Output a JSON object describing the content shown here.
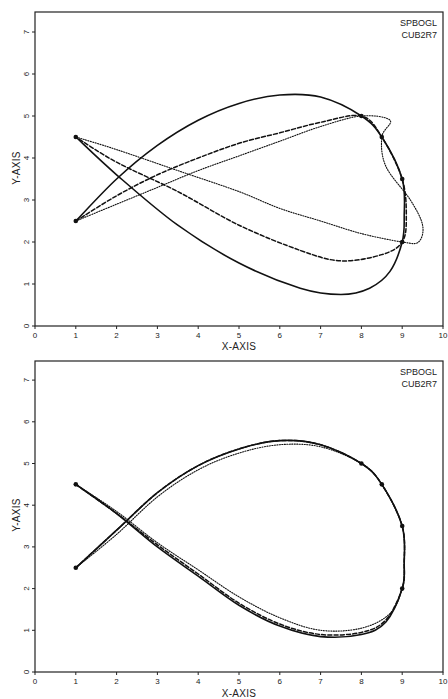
{
  "chart_data": [
    {
      "type": "line",
      "title": "",
      "xlabel": "X-AXIS",
      "ylabel": "Y-AXIS",
      "xlim": [
        0,
        10
      ],
      "ylim": [
        0,
        7.5
      ],
      "xticks": [
        "0",
        "1",
        "2",
        "3",
        "4",
        "5",
        "6",
        "7",
        "8",
        "9",
        "10"
      ],
      "yticks": [
        "0",
        "1",
        "2",
        "3",
        "4",
        "5",
        "6",
        "7"
      ],
      "grid": false,
      "legend": [
        "SPBOGL",
        "CUB2R7"
      ],
      "legend_position": "top-right",
      "nodes": [
        [
          1,
          2.5
        ],
        [
          1,
          4.5
        ],
        [
          8,
          5
        ],
        [
          8.5,
          4.5
        ],
        [
          9,
          3.5
        ],
        [
          9,
          2
        ]
      ],
      "series": [
        {
          "name": "solid",
          "style": "solid",
          "points": [
            [
              1,
              2.5
            ],
            [
              2,
              3.5
            ],
            [
              3,
              4.3
            ],
            [
              4,
              4.9
            ],
            [
              5,
              5.3
            ],
            [
              6,
              5.5
            ],
            [
              7,
              5.45
            ],
            [
              8,
              5.0
            ],
            [
              8.5,
              4.5
            ],
            [
              9,
              3.5
            ],
            [
              9.05,
              2.6
            ],
            [
              9,
              2.0
            ],
            [
              8.7,
              1.3
            ],
            [
              8.2,
              0.9
            ],
            [
              7.5,
              0.75
            ],
            [
              6.5,
              0.9
            ],
            [
              5,
              1.5
            ],
            [
              3.5,
              2.4
            ],
            [
              2,
              3.6
            ],
            [
              1,
              4.5
            ]
          ]
        },
        {
          "name": "dashed",
          "style": "dashed",
          "points": [
            [
              1,
              2.5
            ],
            [
              2,
              3.1
            ],
            [
              3,
              3.6
            ],
            [
              4,
              4.0
            ],
            [
              5,
              4.35
            ],
            [
              6,
              4.6
            ],
            [
              7,
              4.85
            ],
            [
              8,
              5.0
            ],
            [
              8.5,
              4.5
            ],
            [
              9,
              3.5
            ],
            [
              9.1,
              2.6
            ],
            [
              9,
              2.0
            ],
            [
              8.5,
              1.7
            ],
            [
              7.5,
              1.55
            ],
            [
              6.5,
              1.8
            ],
            [
              5,
              2.4
            ],
            [
              3.5,
              3.2
            ],
            [
              2,
              3.9
            ],
            [
              1,
              4.5
            ]
          ]
        },
        {
          "name": "dotted",
          "style": "dotted",
          "points": [
            [
              1,
              2.5
            ],
            [
              2,
              2.9
            ],
            [
              3,
              3.3
            ],
            [
              4,
              3.7
            ],
            [
              5,
              4.05
            ],
            [
              6,
              4.4
            ],
            [
              7,
              4.75
            ],
            [
              8,
              5.0
            ],
            [
              8.7,
              4.9
            ],
            [
              8.5,
              4.5
            ],
            [
              8.6,
              3.8
            ],
            [
              9.2,
              3.0
            ],
            [
              9.5,
              2.4
            ],
            [
              9.4,
              2.0
            ],
            [
              9,
              2.0
            ],
            [
              8,
              2.2
            ],
            [
              7,
              2.5
            ],
            [
              6,
              2.8
            ],
            [
              5,
              3.2
            ],
            [
              3.5,
              3.7
            ],
            [
              2,
              4.2
            ],
            [
              1,
              4.5
            ]
          ]
        }
      ]
    },
    {
      "type": "line",
      "title": "",
      "xlabel": "X-AXIS",
      "ylabel": "Y-AXIS",
      "xlim": [
        0,
        10
      ],
      "ylim": [
        0,
        7.5
      ],
      "xticks": [
        "0",
        "1",
        "2",
        "3",
        "4",
        "5",
        "6",
        "7",
        "8",
        "9",
        "10"
      ],
      "yticks": [
        "0",
        "1",
        "2",
        "3",
        "4",
        "5",
        "6",
        "7"
      ],
      "grid": false,
      "legend": [
        "SPBOGL",
        "CUB2R7"
      ],
      "legend_position": "top-right",
      "nodes": [
        [
          1,
          2.5
        ],
        [
          1,
          4.5
        ],
        [
          8,
          5
        ],
        [
          8.5,
          4.5
        ],
        [
          9,
          3.5
        ],
        [
          9,
          2
        ]
      ],
      "series": [
        {
          "name": "solid",
          "style": "solid",
          "points": [
            [
              1,
              2.5
            ],
            [
              2,
              3.4
            ],
            [
              3,
              4.3
            ],
            [
              4,
              4.95
            ],
            [
              5,
              5.35
            ],
            [
              6,
              5.55
            ],
            [
              7,
              5.45
            ],
            [
              8,
              5.0
            ],
            [
              8.5,
              4.5
            ],
            [
              9,
              3.5
            ],
            [
              9.05,
              2.6
            ],
            [
              9,
              2.0
            ],
            [
              8.6,
              1.2
            ],
            [
              8,
              0.9
            ],
            [
              7,
              0.85
            ],
            [
              6,
              1.1
            ],
            [
              5,
              1.6
            ],
            [
              4,
              2.3
            ],
            [
              3,
              3.0
            ],
            [
              2,
              3.8
            ],
            [
              1,
              4.5
            ]
          ]
        },
        {
          "name": "dashed",
          "style": "dashed",
          "points": [
            [
              1,
              2.5
            ],
            [
              2,
              3.4
            ],
            [
              3,
              4.3
            ],
            [
              4,
              4.95
            ],
            [
              5,
              5.35
            ],
            [
              6,
              5.55
            ],
            [
              7,
              5.45
            ],
            [
              8,
              5.0
            ],
            [
              8.5,
              4.5
            ],
            [
              9,
              3.5
            ],
            [
              9.05,
              2.6
            ],
            [
              9,
              2.0
            ],
            [
              8.6,
              1.25
            ],
            [
              8,
              0.95
            ],
            [
              7,
              0.9
            ],
            [
              6,
              1.15
            ],
            [
              5,
              1.65
            ],
            [
              4,
              2.35
            ],
            [
              3,
              3.05
            ],
            [
              2,
              3.8
            ],
            [
              1,
              4.5
            ]
          ]
        },
        {
          "name": "dotted",
          "style": "dotted",
          "points": [
            [
              1,
              2.5
            ],
            [
              2,
              3.3
            ],
            [
              3,
              4.2
            ],
            [
              4,
              4.85
            ],
            [
              5,
              5.25
            ],
            [
              6,
              5.45
            ],
            [
              7,
              5.4
            ],
            [
              8,
              5.0
            ],
            [
              8.5,
              4.5
            ],
            [
              9,
              3.5
            ],
            [
              9.05,
              2.6
            ],
            [
              9,
              2.0
            ],
            [
              8.7,
              1.4
            ],
            [
              8,
              1.05
            ],
            [
              7,
              1.0
            ],
            [
              6,
              1.3
            ],
            [
              5,
              1.8
            ],
            [
              4,
              2.45
            ],
            [
              3,
              3.1
            ],
            [
              2,
              3.85
            ],
            [
              1,
              4.5
            ]
          ]
        }
      ]
    }
  ],
  "plots": [
    {
      "legend": {
        "line1": "SPBOGL",
        "line2": "CUB2R7"
      },
      "xlabel": "X-AXIS",
      "ylabel": "Y-AXIS"
    },
    {
      "legend": {
        "line1": "SPBOGL",
        "line2": "CUB2R7"
      },
      "xlabel": "X-AXIS",
      "ylabel": "Y-AXIS"
    }
  ]
}
